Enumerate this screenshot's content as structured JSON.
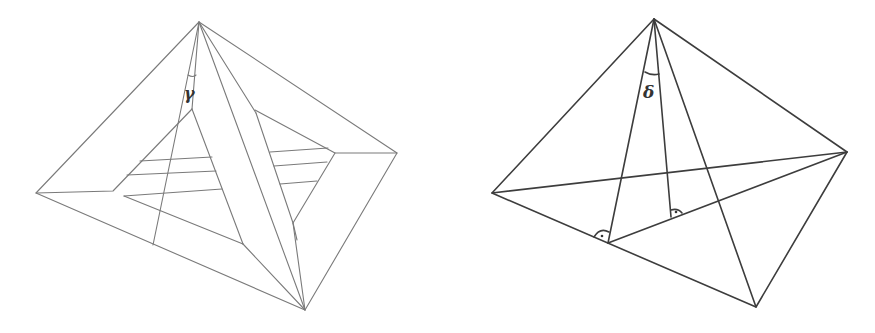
{
  "figures": [
    {
      "id": "left",
      "description": "Pyramid net / unfolded pyramid with hatched inner triangular faces",
      "angle_label": "γ",
      "stroke_color": "#7a7a7a"
    },
    {
      "id": "right",
      "description": "Tetrahedron-like figure with two perpendicular feet marked by right-angle symbols",
      "angle_label": "δ",
      "stroke_color": "#3d3d3d",
      "right_angle_markers": 2
    }
  ]
}
